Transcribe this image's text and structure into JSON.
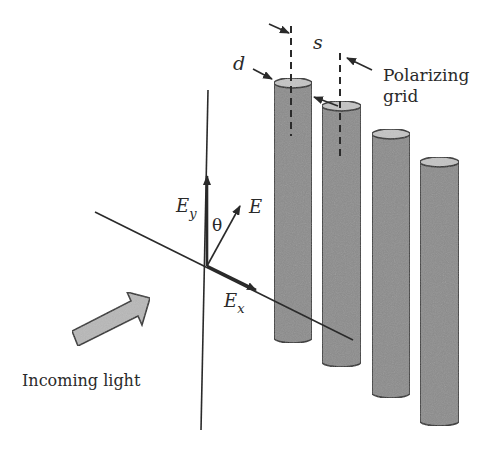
{
  "diagram": {
    "labels": {
      "d": "d",
      "s": "s",
      "polarizing_line1": "Polarizing",
      "polarizing_line2": "grid",
      "E": "E",
      "Ey_main": "E",
      "Ey_sub": "y",
      "Ex_main": "E",
      "Ex_sub": "x",
      "theta": "θ",
      "incoming": "Incoming light"
    },
    "colors": {
      "cylinder_body": "#8c8c8c",
      "cylinder_top": "#c4c4c4",
      "stroke": "#2a2a2a",
      "arrow_fill": "#b8b8b8",
      "background": "#ffffff"
    },
    "cylinders": [
      {
        "x": 274,
        "w": 38,
        "top": 83,
        "bottom": 342
      },
      {
        "x": 322,
        "w": 39,
        "top": 106,
        "bottom": 366
      },
      {
        "x": 372,
        "w": 38,
        "top": 134,
        "bottom": 397
      },
      {
        "x": 420,
        "w": 39,
        "top": 162,
        "bottom": 425
      }
    ],
    "cylinder_count": 4
  }
}
